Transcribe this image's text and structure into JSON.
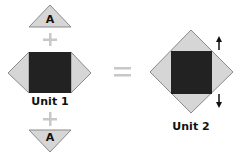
{
  "diagram": {
    "unit1": {
      "label": "Unit 1",
      "top_triangle_letter": "A",
      "bottom_triangle_letter": "A"
    },
    "unit2": {
      "label": "Unit 2"
    },
    "operators": {
      "plus": "+",
      "equals": "="
    },
    "arrows": {
      "up": "up-arrow",
      "down": "down-arrow"
    },
    "colors": {
      "square_fill": "#222222",
      "triangle_fill": "#d6d6d6",
      "triangle_stroke": "#8a8a8a",
      "operator": "#c8c8c8",
      "arrow": "#111111"
    }
  }
}
